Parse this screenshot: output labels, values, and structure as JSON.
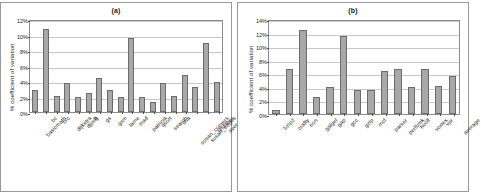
{
  "figure": {
    "panels": [
      {
        "title": "(a)",
        "ylabel": "% coefficient of variation"
      },
      {
        "title": "(b)",
        "ylabel": "% coefficient of variation"
      }
    ]
  },
  "chart_data": [
    {
      "type": "bar",
      "title": "(a)",
      "xlabel": "",
      "ylabel": "% coefficient of variation",
      "ylim": [
        0,
        12
      ],
      "ytick_labels": [
        "0%",
        "2%",
        "4%",
        "6%",
        "8%",
        "10%",
        "12%"
      ],
      "ytick_values": [
        0,
        2,
        4,
        6,
        8,
        10,
        12
      ],
      "grid": true,
      "legend": "none",
      "categories": [
        "basicmath",
        "bc",
        "crc",
        "dijkstra",
        "djpeg",
        "ft",
        "gs",
        "gsm",
        "lame",
        "mad",
        "patricia",
        "qsort",
        "search",
        "sha",
        "susan_corners",
        "susan_edges",
        "tiffdither",
        "average"
      ],
      "values": [
        2.8,
        10.7,
        2.1,
        3.7,
        1.95,
        2.5,
        4.4,
        2.8,
        1.9,
        9.5,
        1.9,
        1.3,
        3.7,
        2.05,
        4.8,
        3.2,
        8.9,
        3.9
      ]
    },
    {
      "type": "bar",
      "title": "(b)",
      "xlabel": "",
      "ylabel": "% coefficient of variation",
      "ylim": [
        0,
        14
      ],
      "ytick_labels": [
        "0%",
        "2%",
        "4%",
        "6%",
        "8%",
        "10%",
        "12%",
        "14%"
      ],
      "ytick_values": [
        0,
        2,
        4,
        6,
        8,
        10,
        12,
        14
      ],
      "grid": true,
      "legend": "none",
      "categories": [
        "bzip2",
        "crafty",
        "eon",
        "galgel",
        "gap",
        "gcc",
        "gzip",
        "mcf",
        "parser",
        "perlbmk",
        "twolf",
        "vortex",
        "vpr",
        "average"
      ],
      "values": [
        0.6,
        6.7,
        12.4,
        2.5,
        4.0,
        11.5,
        3.6,
        3.6,
        6.3,
        6.6,
        4.0,
        6.6,
        4.2,
        5.6
      ]
    }
  ],
  "colors": {
    "bar_fill": "#a8a8a8",
    "bar_edge": "#6b6b6b",
    "grid": "#c8c8c8",
    "axis": "#8c8c8c",
    "text": "#1a1a1a",
    "panel_border": "#9a9a9a"
  }
}
